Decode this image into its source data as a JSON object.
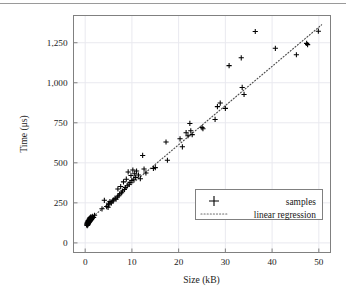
{
  "page": {
    "has_top_rule": true,
    "background_color": "#ffffff"
  },
  "chart_data": {
    "type": "scatter",
    "title": "",
    "xlabel": "Size (kB)",
    "ylabel": "Time (μs)",
    "xlim": [
      -2.5,
      52.5
    ],
    "ylim": [
      -60,
      1420
    ],
    "xticks": [
      0,
      10,
      20,
      30,
      40,
      50
    ],
    "xtick_labels": [
      "0",
      "10",
      "20",
      "30",
      "40",
      "50"
    ],
    "yticks": [
      0,
      250,
      500,
      750,
      1000,
      1250
    ],
    "ytick_labels": [
      "0",
      "250",
      "500",
      "750",
      "1,000",
      "1,250"
    ],
    "grid": true,
    "grid_color": "#e9e9ef",
    "frame_color": "#808080",
    "legend_position": "lower right",
    "series": [
      {
        "name": "samples",
        "type": "scatter",
        "marker": "plus",
        "color": "#000000",
        "points": [
          [
            0.3,
            112
          ],
          [
            0.35,
            118
          ],
          [
            0.4,
            124
          ],
          [
            0.45,
            108
          ],
          [
            0.5,
            130
          ],
          [
            0.5,
            119
          ],
          [
            0.55,
            126
          ],
          [
            0.6,
            136
          ],
          [
            0.62,
            114
          ],
          [
            0.65,
            128
          ],
          [
            0.7,
            140
          ],
          [
            0.72,
            122
          ],
          [
            0.75,
            133
          ],
          [
            0.8,
            145
          ],
          [
            0.82,
            127
          ],
          [
            0.85,
            138
          ],
          [
            0.9,
            150
          ],
          [
            0.92,
            131
          ],
          [
            0.95,
            143
          ],
          [
            1.0,
            155
          ],
          [
            1.02,
            135
          ],
          [
            1.05,
            147
          ],
          [
            1.1,
            158
          ],
          [
            1.12,
            139
          ],
          [
            1.15,
            151
          ],
          [
            1.2,
            162
          ],
          [
            1.25,
            144
          ],
          [
            1.3,
            154
          ],
          [
            1.35,
            148
          ],
          [
            1.4,
            160
          ],
          [
            1.5,
            152
          ],
          [
            1.6,
            165
          ],
          [
            1.8,
            158
          ],
          [
            2.0,
            172
          ],
          [
            3.6,
            213
          ],
          [
            4.1,
            266
          ],
          [
            4.6,
            227
          ],
          [
            4.9,
            222
          ],
          [
            5.0,
            247
          ],
          [
            5.1,
            238
          ],
          [
            5.3,
            258
          ],
          [
            5.6,
            250
          ],
          [
            5.9,
            262
          ],
          [
            6.1,
            268
          ],
          [
            6.4,
            279
          ],
          [
            6.6,
            273
          ],
          [
            6.9,
            287
          ],
          [
            7.0,
            337
          ],
          [
            7.2,
            295
          ],
          [
            7.4,
            306
          ],
          [
            7.6,
            352
          ],
          [
            7.8,
            313
          ],
          [
            8.0,
            324
          ],
          [
            8.2,
            381
          ],
          [
            8.4,
            334
          ],
          [
            8.6,
            346
          ],
          [
            8.8,
            398
          ],
          [
            9.0,
            357
          ],
          [
            9.2,
            443
          ],
          [
            9.4,
            366
          ],
          [
            9.6,
            378
          ],
          [
            9.8,
            421
          ],
          [
            10.0,
            389
          ],
          [
            10.2,
            455
          ],
          [
            10.4,
            398
          ],
          [
            10.6,
            432
          ],
          [
            10.8,
            409
          ],
          [
            11.0,
            449
          ],
          [
            11.4,
            424
          ],
          [
            11.8,
            401
          ],
          [
            12.3,
            546
          ],
          [
            12.6,
            461
          ],
          [
            13.0,
            437
          ],
          [
            14.6,
            465
          ],
          [
            15.0,
            470
          ],
          [
            17.3,
            630
          ],
          [
            17.6,
            516
          ],
          [
            20.3,
            650
          ],
          [
            20.8,
            600
          ],
          [
            21.6,
            688
          ],
          [
            22.0,
            669
          ],
          [
            22.4,
            746
          ],
          [
            22.6,
            700
          ],
          [
            22.9,
            676
          ],
          [
            25.0,
            720
          ],
          [
            25.2,
            713
          ],
          [
            27.8,
            771
          ],
          [
            28.3,
            851
          ],
          [
            28.9,
            873
          ],
          [
            30.0,
            840
          ],
          [
            30.8,
            1107
          ],
          [
            33.4,
            1156
          ],
          [
            33.6,
            971
          ],
          [
            34.0,
            927
          ],
          [
            36.4,
            1320
          ],
          [
            40.7,
            1215
          ],
          [
            45.2,
            1175
          ],
          [
            47.4,
            1246
          ],
          [
            47.6,
            1238
          ],
          [
            49.9,
            1322
          ]
        ]
      },
      {
        "name": "linear regression",
        "type": "line",
        "style": "dotted",
        "color": "#4d4d4d",
        "endpoints": [
          [
            0.2,
            128
          ],
          [
            50.6,
            1362
          ]
        ]
      }
    ],
    "legend": [
      {
        "label": "samples",
        "marker": "plus"
      },
      {
        "label": "linear regression",
        "marker": "dotted-line"
      }
    ]
  }
}
